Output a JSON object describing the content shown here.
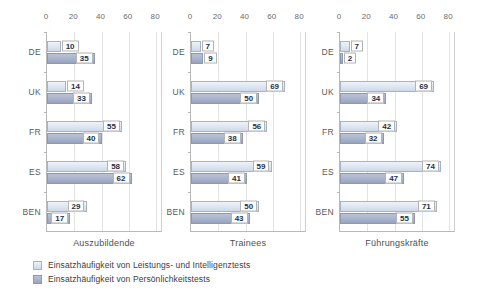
{
  "chart_data": {
    "type": "bar",
    "orientation": "horizontal",
    "title": "",
    "xlabel": "",
    "ylabel": "",
    "xlim": [
      0,
      85
    ],
    "xticks": [
      0,
      20,
      40,
      60,
      80
    ],
    "grid": true,
    "legend_position": "bottom-left",
    "categories": [
      "DE",
      "UK",
      "FR",
      "ES",
      "BEN"
    ],
    "panels": [
      {
        "caption": "Auszubildende",
        "series": [
          {
            "name": "Einsatzhäufigkeit von Leistungs- und Intelligenztests",
            "values": [
              10,
              14,
              55,
              58,
              29
            ]
          },
          {
            "name": "Einsatzhäufigkeit von Persönlichkeitstests",
            "values": [
              35,
              33,
              40,
              62,
              17
            ]
          }
        ]
      },
      {
        "caption": "Trainees",
        "series": [
          {
            "name": "Einsatzhäufigkeit von Leistungs- und Intelligenztests",
            "values": [
              7,
              69,
              56,
              59,
              50
            ]
          },
          {
            "name": "Einsatzhäufigkeit von Persönlichkeitstests",
            "values": [
              9,
              50,
              38,
              41,
              43
            ]
          }
        ]
      },
      {
        "caption": "Führungskräfte",
        "series": [
          {
            "name": "Einsatzhäufigkeit von Leistungs- und Intelligenztests",
            "values": [
              7,
              69,
              42,
              74,
              71
            ]
          },
          {
            "name": "Einsatzhäufigkeit von Persönlichkeitstests",
            "values": [
              2,
              34,
              32,
              47,
              55
            ]
          }
        ]
      }
    ],
    "colors": {
      "series_light": "#dde5f0",
      "series_dark": "#a8b3ca",
      "series_light_border": "#a7b2c4",
      "series_dark_border": "#8d99b0",
      "axis": "#b9b9b9",
      "grid": "#e3e3e3",
      "label_text": "#1f3048"
    }
  },
  "legend": {
    "items": [
      {
        "label": "Einsatzhäufigkeit von Leistungs- und Intelligenztests",
        "swatch": "light"
      },
      {
        "label": "Einsatzhäufigkeit von Persönlichkeitstests",
        "swatch": "dark"
      }
    ]
  }
}
